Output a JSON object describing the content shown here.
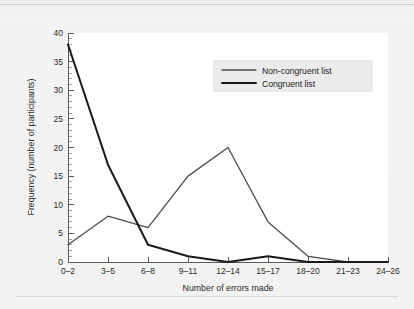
{
  "chart_data": {
    "type": "line",
    "title": "",
    "xlabel": "Number of errors made",
    "ylabel": "Frequency (number of participants)",
    "categories": [
      "0–2",
      "3–5",
      "6–8",
      "9–11",
      "12–14",
      "15–17",
      "18–20",
      "21–23",
      "24–26"
    ],
    "ylim": [
      0,
      40
    ],
    "yticks": [
      0,
      5,
      10,
      15,
      20,
      25,
      30,
      35,
      40
    ],
    "ytick_labels": [
      "0",
      "5",
      "10",
      "15",
      "20",
      "25",
      "30",
      "35",
      "40"
    ],
    "minor_tick_step": 1,
    "grid": false,
    "legend_position": "top-right",
    "series": [
      {
        "name": "Non-congruent list",
        "values": [
          3,
          8,
          6,
          15,
          20,
          7,
          1,
          0,
          0
        ],
        "color": "#4d4d4d",
        "line_width": 1.3
      },
      {
        "name": "Congruent list",
        "values": [
          38,
          17,
          3,
          1,
          0,
          1,
          0,
          0,
          0
        ],
        "color": "#1a1a1a",
        "line_width": 2.0
      }
    ]
  },
  "legend": {
    "entries": [
      {
        "label": "Non-congruent list"
      },
      {
        "label": "Congruent list"
      }
    ]
  },
  "colors": {
    "page_background": "#f2f2f2",
    "plot_background": "#ffffff",
    "axis": "#5a5a5a",
    "text": "#2b2b2b",
    "legend_background": "#ebebeb"
  }
}
